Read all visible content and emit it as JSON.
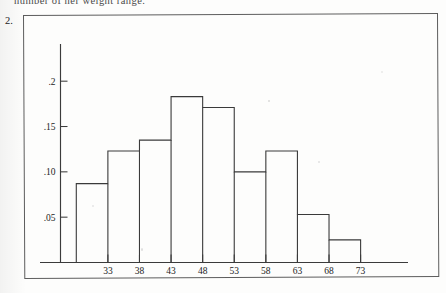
{
  "page": {
    "cutoff_running_text": "number of her weight range.",
    "question_number": "2."
  },
  "chart_data": {
    "type": "bar",
    "title": "",
    "subtitle": "",
    "xlabel": "",
    "ylabel": "",
    "categories": [
      "28-33",
      "33-38",
      "38-43",
      "43-48",
      "48-53",
      "53-58",
      "58-63",
      "63-68",
      "68-73"
    ],
    "bin_edges": [
      28,
      33,
      38,
      43,
      48,
      53,
      58,
      63,
      68,
      73
    ],
    "values": [
      0.087,
      0.123,
      0.135,
      0.183,
      0.171,
      0.1,
      0.123,
      0.053,
      0.025
    ],
    "x_tick_values": [
      33,
      38,
      43,
      48,
      53,
      58,
      63,
      68,
      73
    ],
    "x_tick_labels": [
      "33",
      "38",
      "43",
      "48",
      "53",
      "58",
      "63",
      "68",
      "73"
    ],
    "y_tick_values": [
      0.05,
      0.1,
      0.15,
      0.2
    ],
    "y_tick_labels": [
      ".05",
      ".10",
      ".15",
      ".2"
    ],
    "xlim": [
      25.5,
      80.5
    ],
    "ylim": [
      0,
      0.2355
    ],
    "grid": false,
    "legend": null,
    "bar_fill": "#ffffff",
    "bar_stroke": "#3a3a3a",
    "axis_color": "#3b3b3b"
  }
}
